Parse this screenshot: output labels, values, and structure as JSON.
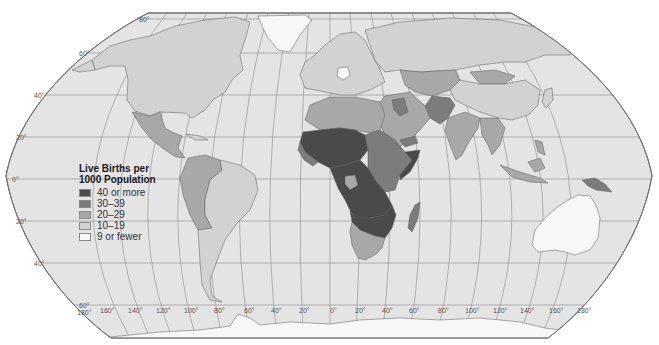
{
  "map": {
    "projection": "Robinson",
    "colors": {
      "ocean": "#e4e4e4",
      "frame": "#6e6e6e",
      "graticule": "#8c8c8c",
      "border": "#5a5a5a",
      "background": "#ffffff"
    },
    "latitude_labels": [
      {
        "text": "80°",
        "x": 139,
        "y": 16
      },
      {
        "text": "60°",
        "x": 79,
        "y": 50
      },
      {
        "text": "40°",
        "x": 34,
        "y": 92
      },
      {
        "text": "20°",
        "x": 16,
        "y": 134
      },
      {
        "text": "0°",
        "x": 12,
        "y": 176
      },
      {
        "text": "20°",
        "x": 16,
        "y": 218
      },
      {
        "text": "40°",
        "x": 34,
        "y": 260
      },
      {
        "text": "60°",
        "x": 79,
        "y": 302
      },
      {
        "text": "180°",
        "x": 77,
        "y": 309
      }
    ],
    "longitude_labels": [
      {
        "text": "160°",
        "x": 100
      },
      {
        "text": "140°",
        "x": 128
      },
      {
        "text": "120°",
        "x": 156
      },
      {
        "text": "100°",
        "x": 184
      },
      {
        "text": "80°",
        "x": 214
      },
      {
        "text": "60°",
        "x": 244
      },
      {
        "text": "40°",
        "x": 271
      },
      {
        "text": "20°",
        "x": 299
      },
      {
        "text": "0°",
        "x": 330
      },
      {
        "text": "20°",
        "x": 355
      },
      {
        "text": "40°",
        "x": 382
      },
      {
        "text": "60°",
        "x": 409
      },
      {
        "text": "80°",
        "x": 438
      },
      {
        "text": "100°",
        "x": 465
      },
      {
        "text": "120°",
        "x": 493
      },
      {
        "text": "140°",
        "x": 520
      },
      {
        "text": "160°",
        "x": 549
      },
      {
        "text": "180°",
        "x": 577
      }
    ]
  },
  "legend": {
    "title_line1": "Live Births per",
    "title_line2": "1000 Population",
    "items": [
      {
        "label": "40 or more",
        "color": "#4a4a4a"
      },
      {
        "label": "30–39",
        "color": "#7c7c7c"
      },
      {
        "label": "20–29",
        "color": "#a8a8a8"
      },
      {
        "label": "10–19",
        "color": "#d2d2d2"
      },
      {
        "label": "9 or fewer",
        "color": "#f7f7f7"
      }
    ]
  },
  "regions": [
    {
      "name": "North America (USA/Canada)",
      "category": "10–19"
    },
    {
      "name": "Greenland",
      "category": "9 or fewer"
    },
    {
      "name": "Mexico / Central America",
      "category": "20–29"
    },
    {
      "name": "South America (north & west)",
      "category": "20–29"
    },
    {
      "name": "Brazil / Argentina / Chile",
      "category": "10–19"
    },
    {
      "name": "Europe",
      "category": "10–19"
    },
    {
      "name": "Germany / Central Europe",
      "category": "9 or fewer"
    },
    {
      "name": "Russia",
      "category": "10–19"
    },
    {
      "name": "Central Asia",
      "category": "20–29"
    },
    {
      "name": "China",
      "category": "10–19"
    },
    {
      "name": "India",
      "category": "20–29"
    },
    {
      "name": "Afghanistan / Pakistan",
      "category": "30–39"
    },
    {
      "name": "Middle East",
      "category": "20–29"
    },
    {
      "name": "North Africa",
      "category": "20–29"
    },
    {
      "name": "Sahel / West Africa",
      "category": "40 or more"
    },
    {
      "name": "Central Africa",
      "category": "40 or more"
    },
    {
      "name": "East Africa",
      "category": "30–39"
    },
    {
      "name": "Southern Africa",
      "category": "20–29"
    },
    {
      "name": "Madagascar",
      "category": "30–39"
    },
    {
      "name": "Southeast Asia",
      "category": "20–29"
    },
    {
      "name": "Papua New Guinea",
      "category": "30–39"
    },
    {
      "name": "Australia",
      "category": "10–19"
    },
    {
      "name": "Antarctica",
      "category": "9 or fewer"
    }
  ]
}
